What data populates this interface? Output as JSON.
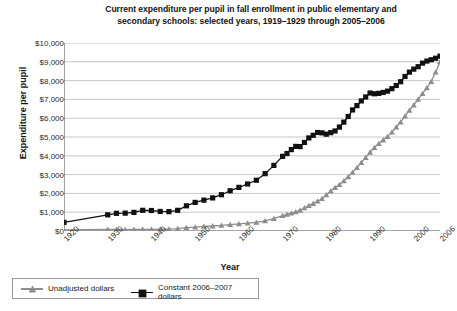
{
  "chart_data": {
    "type": "line",
    "title": "Current expenditure per pupil in fall enrollment in public elementary and secondary schools: selected years, 1919–1929 through 2005–2006",
    "title_line1": "Current expenditure per pupil in fall enrollment in public elementary and",
    "title_line2": "secondary schools: selected years, 1919–1929 through 2005–2006",
    "xlabel": "Year",
    "ylabel": "Expenditure per pupil",
    "ylim": [
      0,
      10000
    ],
    "xlim": [
      1920,
      2006
    ],
    "grid": "horizontal",
    "legend_position": "bottom-left",
    "ytick_labels": [
      "$0",
      "$1,000",
      "$2,000",
      "$3,000",
      "$4,000",
      "$5,000",
      "$6,000",
      "$7,000",
      "$8,000",
      "$9,000",
      "$10,000"
    ],
    "ytick_values": [
      0,
      1000,
      2000,
      3000,
      4000,
      5000,
      6000,
      7000,
      8000,
      9000,
      10000
    ],
    "xtick_labels": [
      "1920",
      "1930",
      "1940",
      "1950",
      "1960",
      "1970",
      "1980",
      "1990",
      "2000",
      "2006"
    ],
    "xtick_values": [
      1920,
      1930,
      1940,
      1950,
      1960,
      1970,
      1980,
      1990,
      2000,
      2006
    ],
    "colors": {
      "unadjusted": "#8d8d8d",
      "constant": "#111111",
      "grid": "#b9b9b9",
      "axis": "#4a4a4a"
    },
    "series": [
      {
        "name": "Unadjusted dollars",
        "marker": "triangle",
        "color": "#8d8d8d",
        "x": [
          1920,
          1930,
          1932,
          1934,
          1936,
          1938,
          1940,
          1942,
          1944,
          1946,
          1948,
          1950,
          1952,
          1954,
          1956,
          1958,
          1960,
          1962,
          1964,
          1966,
          1968,
          1970,
          1971,
          1972,
          1973,
          1974,
          1975,
          1976,
          1977,
          1978,
          1979,
          1980,
          1981,
          1982,
          1983,
          1984,
          1985,
          1986,
          1987,
          1988,
          1989,
          1990,
          1991,
          1992,
          1993,
          1994,
          1995,
          1996,
          1997,
          1998,
          1999,
          2000,
          2001,
          2002,
          2003,
          2004,
          2005,
          2006
        ],
        "values": [
          53,
          87,
          81,
          74,
          79,
          88,
          88,
          94,
          105,
          125,
          180,
          210,
          244,
          265,
          294,
          341,
          375,
          419,
          460,
          538,
          658,
          816,
          879,
          952,
          1016,
          1104,
          1231,
          1348,
          1464,
          1585,
          1718,
          1917,
          2126,
          2302,
          2470,
          2662,
          2880,
          3120,
          3370,
          3640,
          3900,
          4190,
          4440,
          4650,
          4840,
          5020,
          5260,
          5530,
          5790,
          6110,
          6420,
          6700,
          7000,
          7310,
          7610,
          7950,
          8450,
          9000
        ]
      },
      {
        "name": "Constant 2006–2007 dollars",
        "marker": "square",
        "color": "#111111",
        "x": [
          1920,
          1930,
          1932,
          1934,
          1936,
          1938,
          1940,
          1942,
          1944,
          1946,
          1948,
          1950,
          1952,
          1954,
          1956,
          1958,
          1960,
          1962,
          1964,
          1966,
          1968,
          1970,
          1971,
          1972,
          1973,
          1974,
          1975,
          1976,
          1977,
          1978,
          1979,
          1980,
          1981,
          1982,
          1983,
          1984,
          1985,
          1986,
          1987,
          1988,
          1989,
          1990,
          1991,
          1992,
          1993,
          1994,
          1995,
          1996,
          1997,
          1998,
          1999,
          2000,
          2001,
          2002,
          2003,
          2004,
          2005,
          2006
        ],
        "values": [
          460,
          860,
          940,
          950,
          990,
          1100,
          1090,
          1040,
          1030,
          1100,
          1340,
          1520,
          1640,
          1760,
          1930,
          2140,
          2320,
          2500,
          2700,
          3050,
          3490,
          3970,
          4120,
          4330,
          4500,
          4490,
          4710,
          4950,
          5090,
          5240,
          5220,
          5150,
          5230,
          5320,
          5530,
          5790,
          6090,
          6440,
          6670,
          6920,
          7130,
          7340,
          7300,
          7320,
          7370,
          7440,
          7570,
          7740,
          7940,
          8220,
          8450,
          8610,
          8740,
          8930,
          9040,
          9110,
          9190,
          9300
        ]
      }
    ]
  },
  "legend": {
    "items": [
      {
        "label": "Unadjusted dollars"
      },
      {
        "label": "Constant 2006–2007 dollars"
      }
    ]
  }
}
